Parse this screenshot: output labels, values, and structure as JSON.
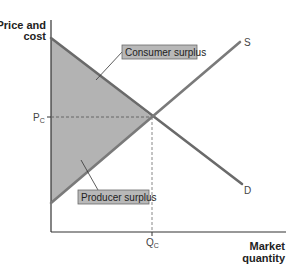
{
  "diagram": {
    "y_axis": {
      "line1": "Price and",
      "line2": "cost"
    },
    "x_axis": {
      "line1": "Market",
      "line2": "quantity"
    },
    "curves": {
      "supply": {
        "label": "S"
      },
      "demand": {
        "label": "D"
      }
    },
    "equilibrium": {
      "price": {
        "main": "P",
        "sub": "C"
      },
      "quantity": {
        "main": "Q",
        "sub": "C"
      }
    },
    "regions": {
      "consumer_surplus": {
        "label": "Consumer surplus"
      },
      "producer_surplus": {
        "label": "Producer surplus"
      }
    },
    "colors": {
      "surplus_fill": "#b3b3b3",
      "curve_stroke": "#6a6a6a",
      "axis": "#333333",
      "label_box_fill": "#b8b8b8",
      "label_box_stroke": "#6a6a6a"
    }
  }
}
